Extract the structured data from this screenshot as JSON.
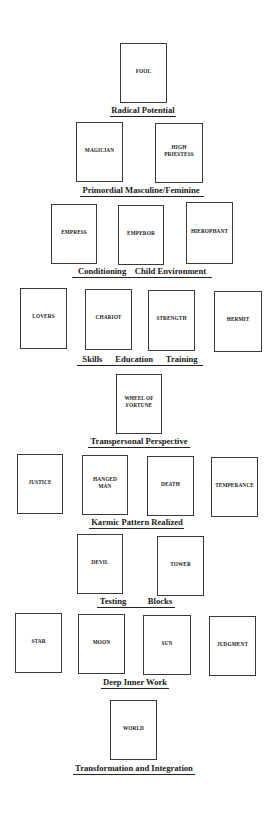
{
  "diagram": {
    "type": "tarot-major-arcana-developmental-layout",
    "rows": [
      {
        "stage": "Radical Potential",
        "cards": [
          {
            "name": "FOOL",
            "x": 120,
            "y": 43,
            "w": 47,
            "h": 60
          }
        ],
        "label": {
          "text": "Radical Potential",
          "cx": 143,
          "y": 105,
          "ux": 110,
          "uw": 66,
          "uy": 116
        }
      },
      {
        "stage": "Primordial Masculine/Feminine",
        "cards": [
          {
            "name": "MAGICIAN",
            "x": 76,
            "y": 122,
            "w": 47,
            "h": 60
          },
          {
            "name": "HIGH\nPRIESTESS",
            "x": 155,
            "y": 123,
            "w": 48,
            "h": 60
          }
        ],
        "label": {
          "text": "Primordial Masculine/Feminine",
          "cx": 141,
          "y": 185,
          "ux": 80,
          "uw": 124,
          "uy": 196
        }
      },
      {
        "stage": "Conditioning Child Environment",
        "cards": [
          {
            "name": "EMPRESS",
            "x": 51,
            "y": 204,
            "w": 46,
            "h": 60
          },
          {
            "name": "EMPEROR",
            "x": 118,
            "y": 205,
            "w": 46,
            "h": 60
          },
          {
            "name": "HIEROPHANT",
            "x": 186,
            "y": 202,
            "w": 47,
            "h": 62
          }
        ],
        "label": {
          "text": "Conditioning    Child Environment",
          "cx": 142,
          "y": 266,
          "ux": 72,
          "uw": 140,
          "uy": 277
        }
      },
      {
        "stage": "Skills Education Training",
        "cards": [
          {
            "name": "LOVERS",
            "x": 20,
            "y": 288,
            "w": 47,
            "h": 61
          },
          {
            "name": "CHARIOT",
            "x": 85,
            "y": 289,
            "w": 47,
            "h": 61
          },
          {
            "name": "STRENGTH",
            "x": 148,
            "y": 290,
            "w": 47,
            "h": 61
          },
          {
            "name": "HERMIT",
            "x": 214,
            "y": 291,
            "w": 48,
            "h": 61
          }
        ],
        "label": {
          "text": "Skills      Education      Training",
          "cx": 140,
          "y": 354,
          "ux": 77,
          "uw": 126,
          "uy": 365
        }
      },
      {
        "stage": "Transpersonal Perspective",
        "cards": [
          {
            "name": "WHEEL OF\nFORTUNE",
            "x": 116,
            "y": 374,
            "w": 46,
            "h": 60
          }
        ],
        "label": {
          "text": "Transpersonal Perspective",
          "cx": 139,
          "y": 436,
          "ux": 88,
          "uw": 102,
          "uy": 447
        }
      },
      {
        "stage": "Karmic Pattern Realized",
        "cards": [
          {
            "name": "JUSTICE",
            "x": 17,
            "y": 454,
            "w": 46,
            "h": 60
          },
          {
            "name": "HANGED\nMAN",
            "x": 82,
            "y": 455,
            "w": 46,
            "h": 60
          },
          {
            "name": "DEATH",
            "x": 147,
            "y": 456,
            "w": 47,
            "h": 60
          },
          {
            "name": "TEMPERANCE",
            "x": 211,
            "y": 457,
            "w": 47,
            "h": 60
          }
        ],
        "label": {
          "text": "Karmic Pattern Realized",
          "cx": 137,
          "y": 517,
          "ux": 89,
          "uw": 95,
          "uy": 528
        }
      },
      {
        "stage": "Testing Blocks",
        "cards": [
          {
            "name": "DEVIL",
            "x": 77,
            "y": 534,
            "w": 46,
            "h": 60
          },
          {
            "name": "TOWER",
            "x": 157,
            "y": 536,
            "w": 47,
            "h": 60
          }
        ],
        "label": {
          "text": "Testing          Blocks",
          "cx": 136,
          "y": 596,
          "ux": 97,
          "uw": 78,
          "uy": 607
        }
      },
      {
        "stage": "Deep Inner Work",
        "cards": [
          {
            "name": "STAR",
            "x": 15,
            "y": 613,
            "w": 47,
            "h": 60
          },
          {
            "name": "MOON",
            "x": 78,
            "y": 614,
            "w": 47,
            "h": 60
          },
          {
            "name": "SUN",
            "x": 143,
            "y": 615,
            "w": 48,
            "h": 60
          },
          {
            "name": "JUDGMENT",
            "x": 209,
            "y": 616,
            "w": 47,
            "h": 60
          }
        ],
        "label": {
          "text": "Deep Inner Work",
          "cx": 135,
          "y": 677,
          "ux": 101,
          "uw": 68,
          "uy": 688
        }
      },
      {
        "stage": "Transformation and Integration",
        "cards": [
          {
            "name": "WORLD",
            "x": 110,
            "y": 700,
            "w": 47,
            "h": 60
          }
        ],
        "label": {
          "text": "Transformation and Integration",
          "cx": 134,
          "y": 763,
          "ux": 73,
          "uw": 122,
          "uy": 774
        }
      }
    ]
  },
  "colors": {
    "background": "#ffffff",
    "card_border": "#3a3a3a",
    "text": "#1a1a1a"
  }
}
